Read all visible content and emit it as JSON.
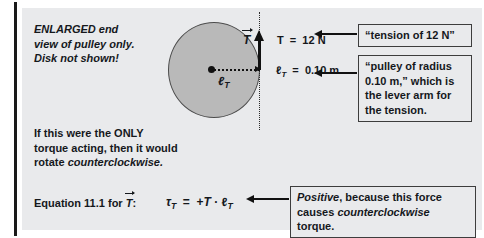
{
  "figure": {
    "notes": {
      "enlarged_line1": "ENLARGED end",
      "enlarged_line2": "view of pulley only.",
      "enlarged_line3": "Disk not shown!",
      "only_torque_line1": "If this were the ONLY",
      "only_torque_line2": "torque acting, then it would",
      "only_torque_line3_prefix": "rotate ",
      "only_torque_line3_italic": "counterclockwise."
    },
    "diagram": {
      "tension_symbol": "T",
      "tension_value": "T  =  12 N",
      "lever_arm_inner_label": "ℓ",
      "lever_arm_inner_sub": "T",
      "lever_arm_value": "ℓ",
      "lever_arm_value_sub": "T",
      "lever_arm_value_rest": "  =  0.10 m"
    },
    "equation": {
      "label_prefix": "Equation 11.1 for ",
      "label_symbol": "T",
      "label_suffix": ":",
      "tau_symbol": "τ",
      "tau_sub": "T",
      "equals": "  =  +",
      "force_symbol": "T",
      "dot": " · ",
      "arm_symbol": "ℓ",
      "arm_sub": "T"
    },
    "callouts": [
      {
        "name": "tension-callout",
        "text": "“tension of 12 N”"
      },
      {
        "name": "pulley-callout",
        "line1": "“pulley of radius",
        "line2": "0.10 m,” which is",
        "line3": "the lever arm for",
        "line4": "the tension."
      },
      {
        "name": "positive-callout",
        "italic1": "Positive",
        "mid": ", because this force",
        "line2_prefix": "causes ",
        "italic2": "counterclockwise",
        "line2_suffix": " torque."
      }
    ],
    "colors": {
      "panel_background": "#e9eaec",
      "pulley_fill": "#b9b9b9",
      "ink": "#15181c",
      "rule": "#1a1a1a"
    }
  }
}
